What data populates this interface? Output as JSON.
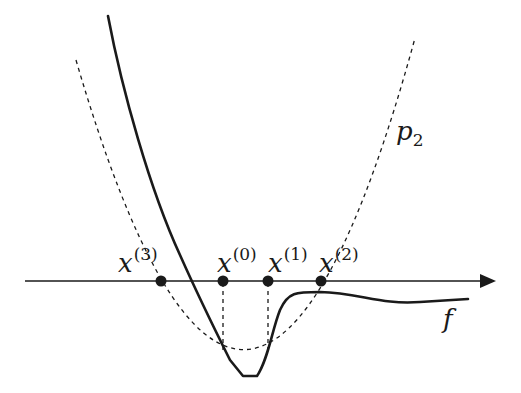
{
  "diagram": {
    "colors": {
      "ink": "#1a1a1a",
      "background": "#ffffff"
    },
    "axis": {
      "name": "horizontal-axis",
      "has_arrow": true
    },
    "labels": {
      "x3": {
        "base": "x",
        "sup": "(3)"
      },
      "x0": {
        "base": "x",
        "sup": "(0)"
      },
      "x1": {
        "base": "x",
        "sup": "(1)"
      },
      "x2": {
        "base": "x",
        "sup": "(2)"
      },
      "p2": {
        "base": "p",
        "sub": "2"
      },
      "f": {
        "base": "f"
      }
    },
    "points": [
      {
        "name": "x(3)",
        "order": 3
      },
      {
        "name": "x(0)",
        "order": 0
      },
      {
        "name": "x(1)",
        "order": 1
      },
      {
        "name": "x(2)",
        "order": 2
      }
    ],
    "curves": [
      {
        "name": "f",
        "style": "solid",
        "label": "f"
      },
      {
        "name": "p2",
        "style": "dashed",
        "label": "p2"
      }
    ]
  }
}
